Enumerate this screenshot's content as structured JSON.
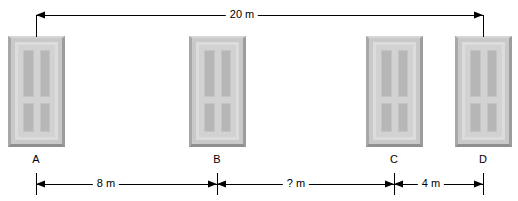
{
  "diagram": {
    "unit": "m",
    "doors": [
      {
        "label": "A",
        "x": 8,
        "y": 36,
        "width": 57,
        "height": 111,
        "tick_x": 36
      },
      {
        "label": "B",
        "x": 189,
        "y": 36,
        "width": 57,
        "height": 111,
        "tick_x": 217
      },
      {
        "label": "C",
        "x": 366,
        "y": 36,
        "width": 57,
        "height": 111,
        "tick_x": 394
      },
      {
        "label": "D",
        "x": 455,
        "y": 36,
        "width": 57,
        "height": 111,
        "tick_x": 483
      }
    ],
    "dimensions_top": [
      {
        "name": "total-span",
        "label": "20 m",
        "from": "A",
        "to": "D",
        "from_x": 36,
        "to_x": 483,
        "line_y": 15,
        "text_x": 242,
        "text_y": 8
      }
    ],
    "dimensions_bottom": [
      {
        "name": "span-a-b",
        "label": "8 m",
        "from": "A",
        "to": "B",
        "from_x": 36,
        "to_x": 217,
        "line_y": 184,
        "text_x": 106,
        "text_y": 177
      },
      {
        "name": "span-b-c",
        "label": "? m",
        "from": "B",
        "to": "C",
        "from_x": 217,
        "to_x": 394,
        "line_y": 184,
        "text_x": 296,
        "text_y": 177
      },
      {
        "name": "span-c-d",
        "label": "4 m",
        "from": "C",
        "to": "D",
        "from_x": 394,
        "to_x": 483,
        "line_y": 184,
        "text_x": 431,
        "text_y": 177
      }
    ],
    "colors": {
      "line": "#000000",
      "background": "#ffffff",
      "door_body": "#c9c9c9",
      "door_frame": "#d2d2d2",
      "door_panel": "#b6b6b6",
      "text": "#000000"
    }
  }
}
